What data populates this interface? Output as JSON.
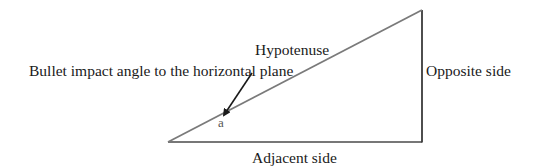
{
  "diagram": {
    "type": "right-triangle",
    "labels": {
      "hypotenuse": "Hypotenuse",
      "annotation": "Bullet impact angle to the horizontal plane",
      "opposite": "Opposite side",
      "adjacent": "Adjacent side",
      "angle": "a"
    },
    "colors": {
      "hypotenuse_line": "#7a7a7a",
      "side_lines": "#4a4a4a",
      "arrow": "#1a1a1a",
      "text": "#1a1a1a",
      "background": "#ffffff"
    }
  }
}
